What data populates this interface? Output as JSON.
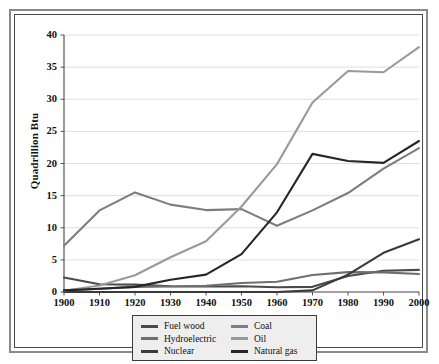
{
  "chart_data": {
    "type": "line",
    "title": "",
    "xlabel": "",
    "ylabel": "Quadrillion Btu",
    "x": [
      1900,
      1910,
      1920,
      1930,
      1940,
      1950,
      1960,
      1970,
      1980,
      1990,
      2000
    ],
    "xlim": [
      1900,
      2000
    ],
    "ylim": [
      0,
      40
    ],
    "ytick_labels": [
      "0",
      "5",
      "10",
      "15",
      "20",
      "25",
      "30",
      "35",
      "40"
    ],
    "ytick_values": [
      0,
      5,
      10,
      15,
      20,
      25,
      30,
      35,
      40
    ],
    "xtick_labels": [
      "1900",
      "1910",
      "1920",
      "1930",
      "1940",
      "1950",
      "1960",
      "1970",
      "1980",
      "1990",
      "2000"
    ],
    "grid": "horizontal",
    "legend_position": "bottom-center",
    "series": [
      {
        "name": "Fuel wood",
        "color": "#4a4a4a",
        "values": [
          2.25,
          1.2,
          1.15,
          0.9,
          0.85,
          0.9,
          0.75,
          0.8,
          2.5,
          3.3,
          3.45
        ]
      },
      {
        "name": "Hydroelectric",
        "color": "#6e6e6e",
        "values": [
          0.25,
          0.5,
          0.8,
          0.85,
          0.95,
          1.4,
          1.6,
          2.65,
          3.1,
          3.05,
          2.8
        ]
      },
      {
        "name": "Nuclear",
        "color": "#3a3a3a",
        "values": [
          0,
          0,
          0,
          0,
          0,
          0,
          0,
          0.25,
          2.7,
          6.1,
          8.2
        ]
      },
      {
        "name": "Coal",
        "color": "#7d7d7d",
        "values": [
          7.2,
          12.7,
          15.5,
          13.6,
          12.75,
          12.9,
          10.3,
          12.7,
          15.4,
          19.2,
          22.4
        ]
      },
      {
        "name": "Oil",
        "color": "#9a9a9a",
        "values": [
          0.2,
          1.0,
          2.6,
          5.4,
          7.9,
          13.3,
          19.9,
          29.5,
          34.4,
          34.2,
          38.1
        ]
      },
      {
        "name": "Natural gas",
        "color": "#262626",
        "values": [
          0.25,
          0.5,
          0.8,
          1.9,
          2.7,
          5.9,
          12.4,
          21.5,
          20.4,
          20.1,
          23.5
        ]
      }
    ]
  },
  "legend": {
    "entries_left": [
      {
        "label": "Fuel wood",
        "color": "#4a4a4a"
      },
      {
        "label": "Hydroelectric",
        "color": "#6e6e6e"
      },
      {
        "label": "Nuclear",
        "color": "#3a3a3a"
      }
    ],
    "entries_right": [
      {
        "label": "Coal",
        "color": "#7d7d7d"
      },
      {
        "label": "Oil",
        "color": "#9a9a9a"
      },
      {
        "label": "Natural gas",
        "color": "#262626"
      }
    ]
  }
}
